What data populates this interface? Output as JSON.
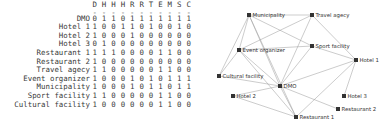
{
  "matrix": {
    "column_headers": [
      "D",
      "H",
      "H",
      "H",
      "R",
      "R",
      "T",
      "E",
      "M",
      "S",
      "C"
    ],
    "dash_separator": "-",
    "row_labels": [
      "DMO",
      "Hotel 1",
      "Hotel 2",
      "Hotel 3",
      "Restaurant 1",
      "Restaurant 2",
      "Travel agecy",
      "Event organizer",
      "Municipality",
      "Sport facility",
      "Cultural facility"
    ],
    "rows": [
      [
        0,
        1,
        1,
        0,
        1,
        1,
        1,
        1,
        1,
        1,
        1
      ],
      [
        1,
        0,
        0,
        1,
        1,
        0,
        1,
        0,
        0,
        1,
        0
      ],
      [
        1,
        0,
        0,
        0,
        1,
        0,
        0,
        0,
        0,
        0,
        0
      ],
      [
        0,
        1,
        0,
        0,
        0,
        0,
        0,
        0,
        0,
        0,
        0
      ],
      [
        1,
        1,
        1,
        0,
        0,
        0,
        0,
        1,
        1,
        0,
        0
      ],
      [
        1,
        0,
        0,
        0,
        0,
        0,
        0,
        0,
        0,
        0,
        0
      ],
      [
        1,
        1,
        0,
        0,
        0,
        0,
        0,
        1,
        1,
        0,
        0
      ],
      [
        1,
        0,
        0,
        0,
        1,
        0,
        1,
        0,
        1,
        1,
        1
      ],
      [
        1,
        0,
        0,
        0,
        1,
        0,
        1,
        1,
        0,
        1,
        1
      ],
      [
        1,
        1,
        0,
        0,
        0,
        0,
        0,
        1,
        1,
        0,
        0
      ],
      [
        1,
        0,
        0,
        0,
        0,
        0,
        0,
        1,
        1,
        0,
        0
      ]
    ]
  },
  "graph": {
    "nodes": [
      {
        "id": "municipality",
        "label": "Municipality",
        "x": 53,
        "y": 15
      },
      {
        "id": "travel-agecy",
        "label": "Travel agecy",
        "x": 116,
        "y": 15
      },
      {
        "id": "event-organizer",
        "label": "Event organizer",
        "x": 43,
        "y": 50
      },
      {
        "id": "sport-facility",
        "label": "Sport facility",
        "x": 116,
        "y": 46
      },
      {
        "id": "hotel-1",
        "label": "Hotel 1",
        "x": 160,
        "y": 60
      },
      {
        "id": "cultural-facility",
        "label": "Cultural facility",
        "x": 23,
        "y": 76
      },
      {
        "id": "dmo",
        "label": "DMO",
        "x": 84,
        "y": 86
      },
      {
        "id": "hotel-2",
        "label": "Hotel 2",
        "x": 37,
        "y": 96
      },
      {
        "id": "hotel-3",
        "label": "Hotel 3",
        "x": 148,
        "y": 96
      },
      {
        "id": "restaurant-2",
        "label": "Restaurant 2",
        "x": 142,
        "y": 109
      },
      {
        "id": "restaurant-1",
        "label": "Restaurant 1",
        "x": 100,
        "y": 117
      }
    ],
    "edges": [
      [
        "dmo",
        "hotel-1"
      ],
      [
        "dmo",
        "hotel-2"
      ],
      [
        "dmo",
        "restaurant-1"
      ],
      [
        "dmo",
        "restaurant-2"
      ],
      [
        "dmo",
        "travel-agecy"
      ],
      [
        "dmo",
        "event-organizer"
      ],
      [
        "dmo",
        "municipality"
      ],
      [
        "dmo",
        "sport-facility"
      ],
      [
        "dmo",
        "cultural-facility"
      ],
      [
        "hotel-1",
        "hotel-3"
      ],
      [
        "hotel-1",
        "restaurant-1"
      ],
      [
        "hotel-1",
        "travel-agecy"
      ],
      [
        "hotel-1",
        "sport-facility"
      ],
      [
        "hotel-2",
        "restaurant-1"
      ],
      [
        "restaurant-1",
        "event-organizer"
      ],
      [
        "restaurant-1",
        "municipality"
      ],
      [
        "travel-agecy",
        "event-organizer"
      ],
      [
        "travel-agecy",
        "municipality"
      ],
      [
        "event-organizer",
        "municipality"
      ],
      [
        "event-organizer",
        "sport-facility"
      ],
      [
        "event-organizer",
        "cultural-facility"
      ],
      [
        "municipality",
        "sport-facility"
      ],
      [
        "municipality",
        "cultural-facility"
      ]
    ],
    "colors": {
      "edge": "#999999",
      "node": "#333333",
      "label": "#333333"
    }
  }
}
